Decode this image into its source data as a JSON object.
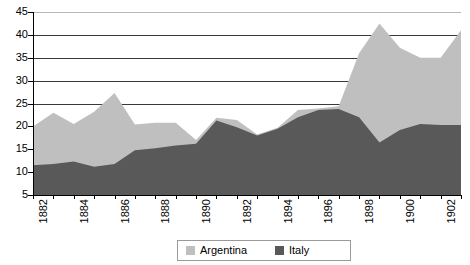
{
  "chart_data": {
    "type": "area",
    "stacked": true,
    "title": "",
    "xlabel": "",
    "ylabel": "",
    "ylim": [
      5,
      45
    ],
    "yticks": [
      5,
      10,
      15,
      20,
      25,
      30,
      35,
      40,
      45
    ],
    "gridlines": [
      25,
      30,
      35,
      40,
      45
    ],
    "grid": true,
    "legend_position": "bottom-center",
    "x": [
      1882,
      1883,
      1884,
      1885,
      1886,
      1887,
      1888,
      1889,
      1890,
      1891,
      1892,
      1893,
      1894,
      1895,
      1896,
      1897,
      1898,
      1899,
      1900,
      1901,
      1902,
      1903
    ],
    "xtick_labels": [
      "1882",
      "",
      "1884",
      "",
      "1886",
      "",
      "1888",
      "",
      "1890",
      "",
      "1892",
      "",
      "1894",
      "",
      "1896",
      "",
      "1898",
      "",
      "1900",
      "",
      "1902",
      ""
    ],
    "series": [
      {
        "name": "Italy",
        "color": "#595959",
        "values": [
          11.5,
          11.8,
          12.3,
          11.2,
          11.8,
          14.8,
          15.2,
          15.8,
          16.2,
          21.3,
          19.8,
          18.0,
          19.5,
          22.0,
          23.6,
          23.8,
          22.0,
          16.5,
          19.2,
          20.5,
          20.3,
          20.3
        ]
      },
      {
        "name": "Argentina",
        "color": "#bfbfbf",
        "values": [
          8.5,
          11.2,
          8.2,
          12.0,
          15.5,
          5.6,
          5.6,
          5.0,
          0.8,
          0.6,
          1.6,
          0.2,
          0.2,
          1.6,
          0.3,
          0.6,
          14.0,
          26.0,
          18.0,
          14.5,
          14.7,
          20.7
        ]
      }
    ],
    "totals": [
      20.0,
      23.0,
      20.5,
      23.2,
      27.3,
      20.4,
      20.8,
      20.8,
      17.0,
      21.9,
      21.4,
      18.2,
      19.7,
      23.6,
      23.9,
      24.4,
      36.0,
      42.5,
      37.2,
      35.0,
      35.0,
      41.0
    ]
  },
  "legend": {
    "entries": [
      {
        "label": "Argentina",
        "color": "#bfbfbf"
      },
      {
        "label": "Italy",
        "color": "#595959"
      }
    ]
  }
}
